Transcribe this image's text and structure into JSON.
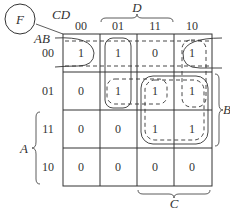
{
  "function_label": "F",
  "col_var_label": "CD",
  "row_var_label": "AB",
  "columns": [
    "00",
    "01",
    "11",
    "10"
  ],
  "rows": [
    "00",
    "01",
    "11",
    "10"
  ],
  "cells": [
    [
      "1",
      "1",
      "0",
      "1"
    ],
    [
      "0",
      "1",
      "1",
      "1"
    ],
    [
      "0",
      "0",
      "1",
      "1"
    ],
    [
      "0",
      "0",
      "0",
      "0"
    ]
  ],
  "braces": {
    "top": "D",
    "bottom": "C",
    "left": "A",
    "right": "B"
  },
  "groups": [
    {
      "name": "wrap-row00-col00-col10",
      "style": "solid"
    },
    {
      "name": "col01-rows00-01",
      "style": "solid"
    },
    {
      "name": "row01-col01-col11",
      "style": "dashed"
    },
    {
      "name": "col10-rows00-01",
      "style": "dashed"
    },
    {
      "name": "square-rows01-11-cols11-10",
      "style": "solid"
    },
    {
      "name": "square-inner-rows01-11-cols11-10",
      "style": "dashed"
    },
    {
      "name": "row00-top-dashed",
      "style": "dashed"
    }
  ],
  "colors": {
    "line": "#333333",
    "background": "#ffffff"
  }
}
